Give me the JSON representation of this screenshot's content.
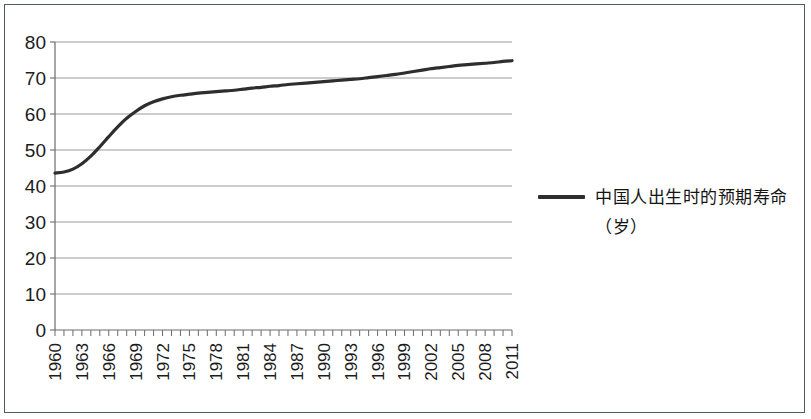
{
  "chart_data": {
    "type": "line",
    "title": "",
    "subtitle": "",
    "xlabel": "",
    "ylabel": "",
    "ylim": [
      0,
      80
    ],
    "ytick_step": 10,
    "ytick_labels": [
      "0",
      "10",
      "20",
      "30",
      "40",
      "50",
      "60",
      "70",
      "80"
    ],
    "xlim": [
      1960,
      2011
    ],
    "grid": true,
    "legend_position": "right",
    "legend": [
      "中国人出生时的预期寿命（岁）"
    ],
    "xtick_labels": [
      "1960",
      "1963",
      "1966",
      "1969",
      "1972",
      "1975",
      "1978",
      "1981",
      "1984",
      "1987",
      "1990",
      "1993",
      "1996",
      "1999",
      "2002",
      "2005",
      "2008",
      "2011"
    ],
    "x": [
      1960,
      1961,
      1962,
      1963,
      1964,
      1965,
      1966,
      1967,
      1968,
      1969,
      1970,
      1971,
      1972,
      1973,
      1974,
      1975,
      1976,
      1977,
      1978,
      1979,
      1980,
      1981,
      1982,
      1983,
      1984,
      1985,
      1986,
      1987,
      1988,
      1989,
      1990,
      1991,
      1992,
      1993,
      1994,
      1995,
      1996,
      1997,
      1998,
      1999,
      2000,
      2001,
      2002,
      2003,
      2004,
      2005,
      2006,
      2007,
      2008,
      2009,
      2010,
      2011
    ],
    "series": [
      {
        "name": "中国人出生时的预期寿命（岁）",
        "color": "#2e2e2e",
        "values": [
          43.6,
          43.9,
          44.7,
          46.2,
          48.3,
          50.9,
          53.7,
          56.4,
          58.8,
          60.7,
          62.3,
          63.4,
          64.2,
          64.8,
          65.2,
          65.5,
          65.8,
          66.0,
          66.2,
          66.4,
          66.6,
          66.9,
          67.2,
          67.4,
          67.7,
          67.9,
          68.2,
          68.4,
          68.6,
          68.8,
          69.0,
          69.2,
          69.4,
          69.6,
          69.8,
          70.1,
          70.4,
          70.7,
          71.0,
          71.4,
          71.8,
          72.2,
          72.6,
          72.9,
          73.2,
          73.5,
          73.7,
          73.9,
          74.1,
          74.3,
          74.6,
          74.8
        ]
      }
    ]
  },
  "legend": {
    "series_label": "中国人出生时的预期寿命（岁）",
    "line_color": "#2e2e2e"
  },
  "axes": {
    "y_ticks": [
      "80",
      "70",
      "60",
      "50",
      "40",
      "30",
      "20",
      "10",
      "0"
    ],
    "x_ticks": [
      "1960",
      "1963",
      "1966",
      "1969",
      "1972",
      "1975",
      "1978",
      "1981",
      "1984",
      "1987",
      "1990",
      "1993",
      "1996",
      "1999",
      "2002",
      "2005",
      "2008",
      "2011"
    ]
  }
}
